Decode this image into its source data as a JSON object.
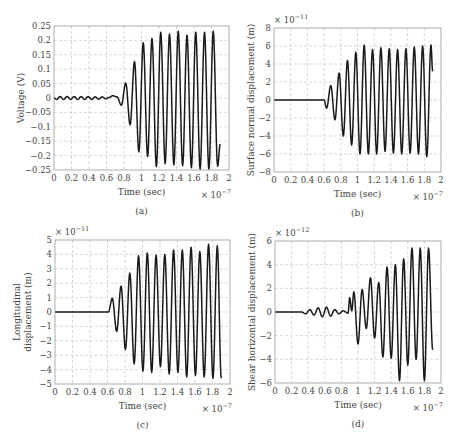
{
  "chart_data": [
    {
      "id": "a",
      "type": "line",
      "caption": "(a)",
      "xlabel": "Time (sec)",
      "ylabel": "Voltage (V)",
      "x_multiplier": "× 10−7",
      "y_multiplier": "",
      "xlim": [
        0,
        2
      ],
      "ylim": [
        -0.25,
        0.25
      ],
      "xticks": [
        "0",
        "0.2",
        "0.4",
        "0.6",
        "0.8",
        "1",
        "1.2",
        "1.4",
        "1.6",
        "1.8",
        "2"
      ],
      "yticks": [
        "0.25",
        "0.2",
        "0.15",
        "0.1",
        "0.05",
        "0",
        "−0.05",
        "−0.1",
        "−0.15",
        "−0.2",
        "−0.25"
      ],
      "ytick_values": [
        0.25,
        0.2,
        0.15,
        0.1,
        0.05,
        0,
        -0.05,
        -0.1,
        -0.15,
        -0.2,
        -0.25
      ],
      "grid": true,
      "series": [
        {
          "name": "Voltage",
          "x_end": 1.9,
          "end_value": -0.16,
          "extrema": [
            [
              0,
              0
            ],
            [
              0.03,
              -0.005
            ],
            [
              0.07,
              0.005
            ],
            [
              0.11,
              -0.005
            ],
            [
              0.15,
              0.005
            ],
            [
              0.19,
              -0.005
            ],
            [
              0.23,
              0.005
            ],
            [
              0.27,
              -0.005
            ],
            [
              0.31,
              0.005
            ],
            [
              0.35,
              -0.005
            ],
            [
              0.39,
              0.005
            ],
            [
              0.43,
              -0.005
            ],
            [
              0.47,
              0.004
            ],
            [
              0.51,
              -0.004
            ],
            [
              0.55,
              0.004
            ],
            [
              0.59,
              -0.003
            ],
            [
              0.63,
              0.002
            ],
            [
              0.67,
              0.008
            ],
            [
              0.72,
              0.004
            ],
            [
              0.77,
              -0.025
            ],
            [
              0.82,
              0.052
            ],
            [
              0.87,
              -0.093
            ],
            [
              0.92,
              0.127
            ],
            [
              0.97,
              -0.187
            ],
            [
              1.02,
              0.192
            ],
            [
              1.07,
              -0.203
            ],
            [
              1.12,
              0.207
            ],
            [
              1.17,
              -0.238
            ],
            [
              1.22,
              0.228
            ],
            [
              1.27,
              -0.228
            ],
            [
              1.32,
              0.222
            ],
            [
              1.37,
              -0.232
            ],
            [
              1.42,
              0.232
            ],
            [
              1.47,
              -0.235
            ],
            [
              1.52,
              0.218
            ],
            [
              1.57,
              -0.242
            ],
            [
              1.62,
              0.228
            ],
            [
              1.67,
              -0.247
            ],
            [
              1.72,
              0.228
            ],
            [
              1.77,
              -0.247
            ],
            [
              1.82,
              0.232
            ],
            [
              1.87,
              -0.237
            ]
          ]
        }
      ]
    },
    {
      "id": "b",
      "type": "line",
      "caption": "(b)",
      "xlabel": "Time (sec)",
      "ylabel": "Surface normal displacement (m)",
      "x_multiplier": "× 10−7",
      "y_multiplier": "× 10−11",
      "xlim": [
        0,
        2
      ],
      "ylim": [
        -8,
        8
      ],
      "xticks": [
        "0",
        "0.2",
        "0.4",
        "0.6",
        "0.8",
        "1",
        "1.2",
        "1.4",
        "1.6",
        "1.8",
        "2"
      ],
      "yticks": [
        "8",
        "6",
        "4",
        "2",
        "0",
        "−2",
        "−4",
        "−6",
        "−8"
      ],
      "ytick_values": [
        8,
        6,
        4,
        2,
        0,
        -2,
        -4,
        -6,
        -8
      ],
      "grid": true,
      "series": [
        {
          "name": "Surface normal displacement",
          "x_end": 1.9,
          "end_value": 3.2,
          "extrema": [
            [
              0,
              0
            ],
            [
              0.6,
              0
            ],
            [
              0.63,
              -0.9
            ],
            [
              0.68,
              1.6
            ],
            [
              0.73,
              -2.2
            ],
            [
              0.78,
              3.0
            ],
            [
              0.83,
              -4.0
            ],
            [
              0.88,
              4.4
            ],
            [
              0.93,
              -5.0
            ],
            [
              0.98,
              5.3
            ],
            [
              1.03,
              -6.0
            ],
            [
              1.08,
              6.1
            ],
            [
              1.13,
              -6.0
            ],
            [
              1.18,
              5.6
            ],
            [
              1.23,
              -6.0
            ],
            [
              1.28,
              5.8
            ],
            [
              1.33,
              -5.7
            ],
            [
              1.38,
              5.7
            ],
            [
              1.43,
              -5.9
            ],
            [
              1.48,
              5.6
            ],
            [
              1.53,
              -6.0
            ],
            [
              1.58,
              5.7
            ],
            [
              1.63,
              -5.9
            ],
            [
              1.68,
              5.9
            ],
            [
              1.73,
              -6.0
            ],
            [
              1.78,
              6.0
            ],
            [
              1.83,
              -6.3
            ],
            [
              1.88,
              6.1
            ]
          ]
        }
      ]
    },
    {
      "id": "c",
      "type": "line",
      "caption": "(c)",
      "xlabel": "Time (sec)",
      "ylabel": "Longitudinal displacement (m)",
      "ylabel_lines": [
        "Longitudinal",
        "displacement (m)"
      ],
      "x_multiplier": "× 10−7",
      "y_multiplier": "× 10−11",
      "xlim": [
        0,
        2
      ],
      "ylim": [
        -5,
        5
      ],
      "xticks": [
        "0",
        "0.2",
        "0.4",
        "0.6",
        "0.8",
        "1",
        "1.2",
        "1.4",
        "1.6",
        "1.8",
        "2"
      ],
      "yticks": [
        "5",
        "4",
        "3",
        "2",
        "1",
        "0",
        "−1",
        "−2",
        "−3",
        "−4",
        "−5"
      ],
      "ytick_values": [
        5,
        4,
        3,
        2,
        1,
        0,
        -1,
        -2,
        -3,
        -4,
        -5
      ],
      "grid": true,
      "series": [
        {
          "name": "Longitudinal displacement",
          "x_end": 1.9,
          "end_value": -4.6,
          "extrema": [
            [
              0,
              0
            ],
            [
              0.61,
              0
            ],
            [
              0.655,
              0.95
            ],
            [
              0.705,
              -1.35
            ],
            [
              0.755,
              1.8
            ],
            [
              0.805,
              -2.6
            ],
            [
              0.855,
              2.7
            ],
            [
              0.905,
              -3.6
            ],
            [
              0.955,
              3.9
            ],
            [
              1.005,
              -4.1
            ],
            [
              1.055,
              4.1
            ],
            [
              1.105,
              -4.2
            ],
            [
              1.155,
              3.95
            ],
            [
              1.205,
              -3.8
            ],
            [
              1.255,
              4.0
            ],
            [
              1.305,
              -4.3
            ],
            [
              1.355,
              4.3
            ],
            [
              1.405,
              -4.2
            ],
            [
              1.455,
              4.3
            ],
            [
              1.505,
              -4.5
            ],
            [
              1.555,
              4.5
            ],
            [
              1.605,
              -4.4
            ],
            [
              1.655,
              4.2
            ],
            [
              1.705,
              -4.5
            ],
            [
              1.755,
              4.7
            ],
            [
              1.805,
              -4.6
            ],
            [
              1.855,
              4.6
            ]
          ]
        }
      ]
    },
    {
      "id": "d",
      "type": "line",
      "caption": "(d)",
      "xlabel": "Time (sec)",
      "ylabel": "Shear horizontal displacement (m)",
      "x_multiplier": "× 10−7",
      "y_multiplier": "× 10−12",
      "xlim": [
        0,
        2
      ],
      "ylim": [
        -6,
        6
      ],
      "xticks": [
        "0",
        "0.2",
        "0.4",
        "0.6",
        "0.8",
        "1",
        "1.2",
        "1.4",
        "1.6",
        "1.8",
        "2"
      ],
      "yticks": [
        "6",
        "4",
        "2",
        "0",
        "−2",
        "−4",
        "−6"
      ],
      "ytick_values": [
        6,
        4,
        2,
        0,
        -2,
        -4,
        -6
      ],
      "grid": true,
      "series": [
        {
          "name": "Shear horizontal displacement",
          "x_end": 1.9,
          "end_value": -3.2,
          "extrema": [
            [
              0,
              0
            ],
            [
              0.32,
              0
            ],
            [
              0.37,
              -0.15
            ],
            [
              0.42,
              0.2
            ],
            [
              0.47,
              -0.25
            ],
            [
              0.52,
              0.35
            ],
            [
              0.57,
              -0.4
            ],
            [
              0.62,
              0.4
            ],
            [
              0.67,
              -0.35
            ],
            [
              0.72,
              0.2
            ],
            [
              0.77,
              -0.15
            ],
            [
              0.82,
              0.1
            ],
            [
              0.88,
              -0.1
            ],
            [
              0.9,
              1.2
            ],
            [
              0.925,
              0.1
            ],
            [
              0.95,
              1.7
            ],
            [
              1.0,
              -2.7
            ],
            [
              1.05,
              1.9
            ],
            [
              1.1,
              -1.4
            ],
            [
              1.15,
              2.9
            ],
            [
              1.2,
              -2.2
            ],
            [
              1.25,
              2.5
            ],
            [
              1.3,
              -3.8
            ],
            [
              1.35,
              3.8
            ],
            [
              1.4,
              -3.9
            ],
            [
              1.45,
              4.0
            ],
            [
              1.5,
              -5.8
            ],
            [
              1.55,
              4.5
            ],
            [
              1.6,
              -4.5
            ],
            [
              1.65,
              5.4
            ],
            [
              1.7,
              -4.0
            ],
            [
              1.75,
              5.4
            ],
            [
              1.8,
              -5.8
            ],
            [
              1.85,
              5.4
            ]
          ]
        }
      ]
    }
  ],
  "layout_boxes": [
    {
      "x0": 54,
      "y0": 26,
      "x1": 229,
      "y1": 170
    },
    {
      "x0": 274,
      "y0": 28,
      "x1": 441,
      "y1": 172
    },
    {
      "x0": 55,
      "y0": 240,
      "x1": 230,
      "y1": 384
    },
    {
      "x0": 275,
      "y0": 241,
      "x1": 441,
      "y1": 383
    }
  ]
}
